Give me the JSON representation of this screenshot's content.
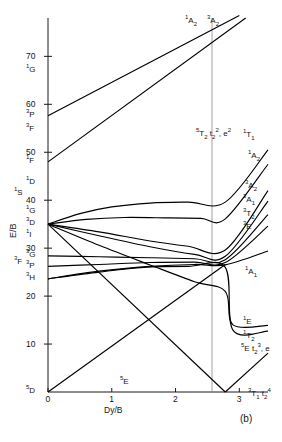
{
  "figure": {
    "panel_letter": "(b)",
    "axes": {
      "y_axis_title": "E/B",
      "x_axis_title": "Dy/B",
      "y_ticks": [
        {
          "value": 70,
          "label": "70"
        },
        {
          "value": 60,
          "label": "60"
        },
        {
          "value": 50,
          "label": "50"
        },
        {
          "value": 40,
          "label": "40"
        },
        {
          "value": 30,
          "label": "30"
        },
        {
          "value": 20,
          "label": "20"
        },
        {
          "value": 10,
          "label": "10"
        }
      ],
      "x_ticks": [
        {
          "value": 0,
          "label": "0"
        },
        {
          "value": 1,
          "label": "1"
        },
        {
          "value": 2,
          "label": "2"
        },
        {
          "value": 3,
          "label": "3"
        }
      ],
      "ylim": [
        0,
        78
      ],
      "xlim": [
        0,
        3.45
      ],
      "grid": false
    },
    "free_ion_terms": [
      {
        "label_sup": "1",
        "label_letter": "G",
        "y": 67.0
      },
      {
        "label_sup": "3",
        "label_letter": "P",
        "y": 57.6
      },
      {
        "label_sup": "3",
        "label_letter": "F",
        "y": 54.6
      },
      {
        "label_sup": "1",
        "label_letter": "F",
        "y": 48.0
      },
      {
        "label_sup": "1",
        "label_letter": "D",
        "y": 43.6
      },
      {
        "label_sup": "1",
        "label_letter": "S",
        "y": 41.2
      },
      {
        "label_sup": "1",
        "label_letter": "G",
        "y": 37.5
      },
      {
        "label_sup": "3",
        "label_letter": "D",
        "y": 35.0
      },
      {
        "label_sup": "1",
        "label_letter": "I",
        "y": 32.6
      },
      {
        "label_sup": "3",
        "label_letter": "G",
        "y": 28.4
      },
      {
        "label_sup": "3",
        "label_letter": "F",
        "y": 26.9
      },
      {
        "label_sup": "3",
        "label_letter": "P",
        "y": 26.0
      },
      {
        "label_sup": "3",
        "label_letter": "H",
        "y": 23.6
      },
      {
        "label_sup": "5",
        "label_letter": "D",
        "y": 0.0
      }
    ],
    "strong_field_labels": [
      {
        "text": "3A2",
        "html": "<sup>3</sup>A<sub>2</sub>",
        "x": 207,
        "y": 17
      },
      {
        "text": "1A2",
        "html": "<sup>1</sup>A<sub>2</sub>",
        "x": 185,
        "y": 17
      },
      {
        "text": "5T2 t2-2, e2",
        "html": "<sup>5</sup>T<sub>2</sub> t<sub>2</sub><sup>2</sup>, e<sup>2</sup>",
        "x": 196,
        "y": 130
      },
      {
        "text": "1T1",
        "html": "<sup>1</sup>T<sub>1</sub>",
        "x": 243,
        "y": 131
      },
      {
        "text": "1A2",
        "html": "<sup>1</sup>A<sub>2</sub>",
        "x": 248,
        "y": 152
      },
      {
        "text": "3A2",
        "html": "<sup>3</sup>A<sub>2</sub>",
        "x": 245,
        "y": 182
      },
      {
        "text": "3A1",
        "html": "<sup>3</sup>A<sub>1</sub>",
        "x": 243,
        "y": 196
      },
      {
        "text": "3T2",
        "html": "<sup>3</sup>T<sub>2</sub>",
        "x": 243,
        "y": 210
      },
      {
        "text": "3E",
        "html": "<sup>3</sup>E",
        "x": 243,
        "y": 223
      },
      {
        "text": "1A1",
        "html": "<sup>1</sup>A<sub>1</sub>",
        "x": 245,
        "y": 268
      },
      {
        "text": "1E",
        "html": "<sup>1</sup>E",
        "x": 243,
        "y": 318
      },
      {
        "text": "1T2",
        "html": "<sup>1</sup>T<sub>2</sub>",
        "x": 243,
        "y": 332
      },
      {
        "text": "5E t2-3, e",
        "html": "<sup>5</sup>E t<sub>2</sub><sup>3</sup>, e",
        "x": 241,
        "y": 345
      },
      {
        "text": "3T1 t2-4",
        "html": "<sup>3</sup>T<sub>1</sub> t<sub>2</sub><sup>4</sup>",
        "x": 248,
        "y": 390
      },
      {
        "text": "5E",
        "html": "<sup>5</sup>E",
        "x": 120,
        "y": 378
      }
    ]
  },
  "chart_data": {
    "type": "line",
    "title": "",
    "subtitle": "",
    "xlabel": "Dy/B",
    "ylabel": "E/B",
    "xlim": [
      0,
      3.45
    ],
    "ylim": [
      0,
      78
    ],
    "grid": false,
    "legend_position": "right-inline-labels",
    "x_ticks": [
      0,
      1,
      2,
      3
    ],
    "y_ticks": [
      10,
      20,
      30,
      40,
      50,
      60,
      70
    ],
    "crossover_x": 2.78,
    "left_terms": [
      "1G",
      "3P",
      "3F",
      "1F",
      "1D",
      "1S",
      "1G",
      "3D",
      "1I",
      "3G",
      "3F",
      "3P",
      "3H",
      "5D"
    ],
    "right_terms": [
      "3A2",
      "1A2",
      "1T1",
      "1A2",
      "3A2",
      "3A1",
      "3T2",
      "3E",
      "1A1",
      "1E",
      "1T2",
      "5E",
      "3T1"
    ],
    "series": [
      {
        "name": "3A2-upper",
        "label": "3A2",
        "points": [
          [
            0,
            57.6
          ],
          [
            3.0,
            78.5
          ]
        ]
      },
      {
        "name": "1A2-upper",
        "label": "1A2",
        "points": [
          [
            0,
            48.0
          ],
          [
            3.1,
            78.0
          ]
        ]
      },
      {
        "name": "1T1",
        "label": "1T1",
        "points": [
          [
            0,
            35.0
          ],
          [
            0.5,
            37.2
          ],
          [
            1.0,
            38.6
          ],
          [
            1.6,
            39.4
          ],
          [
            2.2,
            39.6
          ],
          [
            2.78,
            39.6
          ],
          [
            3.45,
            50.5
          ]
        ]
      },
      {
        "name": "1A2-mid",
        "label": "1A2",
        "points": [
          [
            0,
            35.0
          ],
          [
            0.6,
            36.0
          ],
          [
            1.2,
            36.4
          ],
          [
            1.9,
            36.3
          ],
          [
            2.4,
            36.2
          ],
          [
            2.78,
            36.1
          ],
          [
            3.45,
            47.5
          ]
        ]
      },
      {
        "name": "3A2-mid",
        "label": "3A2",
        "points": [
          [
            0,
            35.0
          ],
          [
            0.8,
            33.4
          ],
          [
            1.6,
            31.5
          ],
          [
            2.2,
            30.4
          ],
          [
            2.78,
            29.6
          ],
          [
            3.45,
            42.0
          ]
        ]
      },
      {
        "name": "3A1",
        "label": "3A1",
        "points": [
          [
            0,
            35.0
          ],
          [
            0.8,
            32.6
          ],
          [
            1.6,
            30.3
          ],
          [
            2.3,
            28.7
          ],
          [
            2.78,
            28.3
          ],
          [
            3.45,
            39.8
          ]
        ]
      },
      {
        "name": "3T2",
        "label": "3T2",
        "points": [
          [
            0,
            28.4
          ],
          [
            0.8,
            28.2
          ],
          [
            1.6,
            28.0
          ],
          [
            2.3,
            27.8
          ],
          [
            2.78,
            27.6
          ],
          [
            3.45,
            37.0
          ]
        ]
      },
      {
        "name": "3E",
        "label": "3E",
        "points": [
          [
            0,
            26.2
          ],
          [
            0.8,
            26.6
          ],
          [
            1.6,
            27.0
          ],
          [
            2.3,
            27.1
          ],
          [
            2.78,
            27.0
          ],
          [
            3.45,
            34.6
          ]
        ]
      },
      {
        "name": "1A1",
        "label": "1A1",
        "points": [
          [
            0,
            23.6
          ],
          [
            0.8,
            25.2
          ],
          [
            1.6,
            26.2
          ],
          [
            2.3,
            26.6
          ],
          [
            2.78,
            26.5
          ],
          [
            3.45,
            29.4
          ]
        ]
      },
      {
        "name": "1E",
        "label": "1E",
        "points": [
          [
            0,
            35.0
          ],
          [
            0.8,
            30.6
          ],
          [
            1.6,
            26.5
          ],
          [
            2.3,
            23.0
          ],
          [
            2.78,
            21.0
          ],
          [
            2.9,
            14.0
          ],
          [
            3.45,
            13.9
          ]
        ]
      },
      {
        "name": "1T2",
        "label": "1T2",
        "points": [
          [
            0,
            23.6
          ],
          [
            0.8,
            25.0
          ],
          [
            1.5,
            26.0
          ],
          [
            2.2,
            26.2
          ],
          [
            2.78,
            26.0
          ],
          [
            2.9,
            12.9
          ],
          [
            3.45,
            12.7
          ]
        ]
      },
      {
        "name": "5E",
        "label": "5E",
        "points": [
          [
            0,
            0.0
          ],
          [
            2.78,
            26.6
          ]
        ]
      },
      {
        "name": "5T2",
        "label": "5T2",
        "points": [
          [
            0,
            35.0
          ],
          [
            2.78,
            0.0
          ]
        ]
      },
      {
        "name": "3T1",
        "label": "3T1",
        "points": [
          [
            2.78,
            0.0
          ],
          [
            3.45,
            8.1
          ]
        ]
      }
    ]
  }
}
